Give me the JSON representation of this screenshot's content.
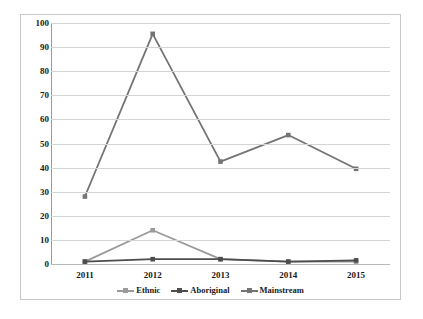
{
  "chart_data": {
    "type": "line",
    "title": "",
    "subtitle": "",
    "xlabel": "",
    "ylabel": "",
    "categories": [
      "2011",
      "2012",
      "2013",
      "2014",
      "2015"
    ],
    "x": [
      2011,
      2012,
      2013,
      2014,
      2015
    ],
    "ylim": [
      0,
      100
    ],
    "ytick_step": 10,
    "yticks": [
      "100",
      "90",
      "80",
      "70",
      "60",
      "50",
      "40",
      "30",
      "20",
      "10",
      "0"
    ],
    "ytick_values": [
      100,
      90,
      80,
      70,
      60,
      50,
      40,
      30,
      20,
      10,
      0
    ],
    "grid": "horizontal",
    "legend_position": "bottom",
    "series": [
      {
        "name": "Ethnic",
        "values": [
          1,
          14,
          2,
          1,
          1
        ],
        "color": "#9a9a9a",
        "marker": "square"
      },
      {
        "name": "Aboriginal",
        "values": [
          1,
          2,
          2,
          1,
          1.5
        ],
        "color": "#4d4d4d",
        "marker": "square"
      },
      {
        "name": "Mainstream",
        "values": [
          28,
          95.5,
          42.5,
          53.5,
          39.5
        ],
        "color": "#747474",
        "marker": "square"
      }
    ]
  },
  "colors": {
    "gridline": "#d4d4d4",
    "axis": "#9a9a9a",
    "frame_border": "#c9c9c9",
    "text": "#1a1a1a",
    "background": "#ffffff"
  }
}
